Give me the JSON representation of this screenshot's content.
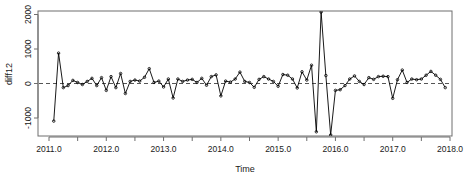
{
  "chart_data": {
    "type": "line",
    "title": "",
    "xlabel": "Time",
    "ylabel": "diff12",
    "xlim": [
      2010.75,
      2018.0
    ],
    "ylim": [
      -1650,
      2150
    ],
    "grid": false,
    "legend": null,
    "xticks": [
      "2011.0",
      "2012.0",
      "2013.0",
      "2014.0",
      "2015.0",
      "2016.0",
      "2017.0",
      "2018.0"
    ],
    "xtick_values": [
      2011.0,
      2012.0,
      2013.0,
      2014.0,
      2015.0,
      2016.0,
      2017.0,
      2018.0
    ],
    "xminor_values": [
      2011.5,
      2012.5,
      2013.5,
      2014.5,
      2015.5,
      2016.5,
      2017.5
    ],
    "yticks": [
      "-1000",
      "0",
      "1000",
      "2000"
    ],
    "ytick_values": [
      -1000,
      0,
      1000,
      2000
    ],
    "reference_line": {
      "y": 0,
      "style": "dashed",
      "color": "#555555"
    },
    "marker": "open-circle",
    "line_color": "#000000",
    "series": [
      {
        "name": "diff12",
        "x": [
          2011.083,
          2011.167,
          2011.25,
          2011.333,
          2011.417,
          2011.5,
          2011.583,
          2011.667,
          2011.75,
          2011.833,
          2011.917,
          2012.0,
          2012.083,
          2012.167,
          2012.25,
          2012.333,
          2012.417,
          2012.5,
          2012.583,
          2012.667,
          2012.75,
          2012.833,
          2012.917,
          2013.0,
          2013.083,
          2013.167,
          2013.25,
          2013.333,
          2013.417,
          2013.5,
          2013.583,
          2013.667,
          2013.75,
          2013.833,
          2013.917,
          2014.0,
          2014.083,
          2014.167,
          2014.25,
          2014.333,
          2014.417,
          2014.5,
          2014.583,
          2014.667,
          2014.75,
          2014.833,
          2014.917,
          2015.0,
          2015.083,
          2015.167,
          2015.25,
          2015.333,
          2015.417,
          2015.5,
          2015.583,
          2015.667,
          2015.75,
          2015.833,
          2015.917,
          2016.0,
          2016.083,
          2016.167,
          2016.25,
          2016.333,
          2016.417,
          2016.5,
          2016.583,
          2016.667,
          2016.75,
          2016.833,
          2016.917,
          2017.0,
          2017.083,
          2017.167,
          2017.25,
          2017.333,
          2017.417,
          2017.5,
          2017.583,
          2017.667,
          2017.75,
          2017.833,
          2017.917
        ],
        "values": [
          -1090,
          880,
          -120,
          -60,
          90,
          30,
          -30,
          60,
          150,
          -60,
          170,
          -200,
          200,
          -120,
          290,
          -290,
          60,
          100,
          70,
          180,
          430,
          30,
          70,
          -100,
          130,
          -420,
          130,
          60,
          100,
          120,
          30,
          150,
          -50,
          200,
          250,
          -360,
          70,
          40,
          130,
          330,
          60,
          30,
          -110,
          120,
          200,
          130,
          60,
          -80,
          260,
          240,
          130,
          -130,
          340,
          100,
          530,
          -1400,
          2070,
          230,
          -1490,
          -200,
          -180,
          -60,
          130,
          220,
          60,
          -30,
          170,
          120,
          200,
          210,
          200,
          -430,
          110,
          390,
          30,
          130,
          110,
          130,
          240,
          350,
          240,
          120,
          -120
        ]
      }
    ]
  },
  "axes": {
    "y_label": "diff12",
    "x_label": "Time"
  }
}
